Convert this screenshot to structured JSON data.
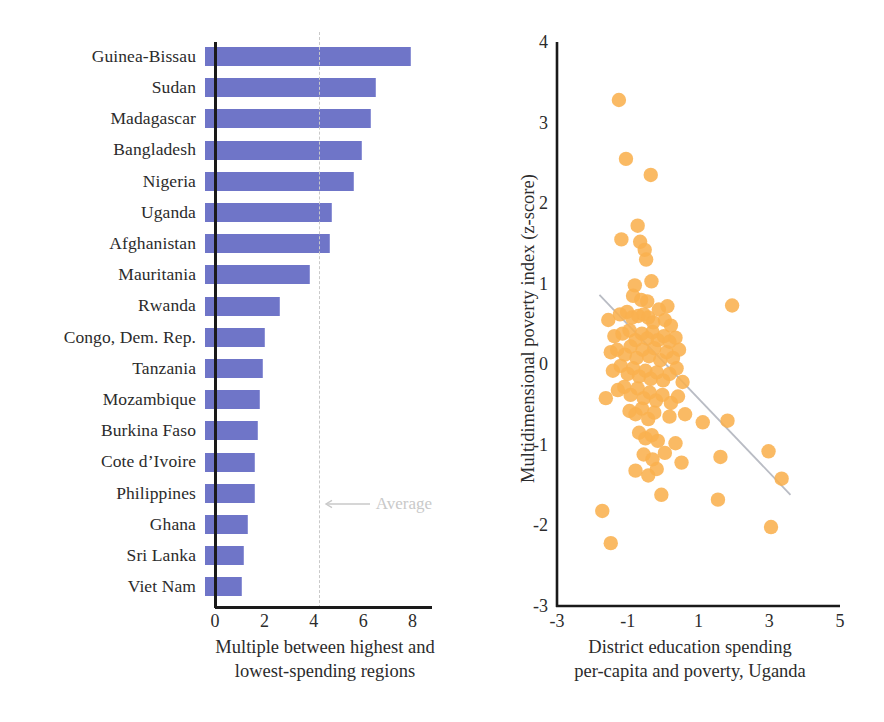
{
  "chart_data": [
    {
      "type": "bar",
      "orientation": "horizontal",
      "title": "",
      "xlabel": "Multiple between highest and lowest-spending regions",
      "ylabel": "",
      "xlim": [
        0,
        9.2
      ],
      "xticks": [
        0,
        2,
        4,
        6,
        8
      ],
      "grid": false,
      "bar_color": "#6f75c8",
      "categories": [
        "Guinea-Bissau",
        "Sudan",
        "Madagascar",
        "Bangladesh",
        "Nigeria",
        "Uganda",
        "Afghanistan",
        "Mauritania",
        "Rwanda",
        "Congo, Dem. Rep.",
        "Tanzania",
        "Mozambique",
        "Burkina Faso",
        "Cote d’Ivoire",
        "Philippines",
        "Ghana",
        "Sri Lanka",
        "Viet Nam"
      ],
      "values": [
        8.3,
        6.9,
        6.7,
        6.3,
        6.0,
        5.1,
        5.0,
        4.2,
        3.0,
        2.4,
        2.3,
        2.2,
        2.1,
        2.0,
        2.0,
        1.7,
        1.55,
        1.45
      ],
      "annotations": [
        {
          "label": "Average",
          "value": 4.2,
          "type": "reference-line",
          "color": "#c9c9c9"
        }
      ]
    },
    {
      "type": "scatter",
      "title": "",
      "xlabel": "District education spending per-capita and poverty, Uganda",
      "xlabel_line1": "District education spending",
      "xlabel_line2": "per-capita and poverty, Uganda",
      "ylabel": "Multidimensional poverty index (z-score)",
      "xlim": [
        -3,
        5
      ],
      "ylim": [
        -3,
        4
      ],
      "xticks": [
        -3,
        -1,
        1,
        3,
        5
      ],
      "yticks": [
        4,
        3,
        2,
        1,
        0,
        -1,
        -2,
        -3
      ],
      "grid": false,
      "point_color": "#f9b04f",
      "trendline": {
        "color": "#b9bcc4",
        "x": [
          -1.8,
          3.6
        ],
        "y": [
          0.86,
          -1.62
        ]
      },
      "points": [
        [
          -1.25,
          3.28
        ],
        [
          -1.05,
          2.55
        ],
        [
          -0.35,
          2.35
        ],
        [
          -0.72,
          1.72
        ],
        [
          -1.18,
          1.55
        ],
        [
          -0.65,
          1.52
        ],
        [
          -0.52,
          1.42
        ],
        [
          -0.48,
          1.3
        ],
        [
          -0.8,
          0.98
        ],
        [
          -0.33,
          1.03
        ],
        [
          -0.85,
          0.85
        ],
        [
          -0.62,
          0.8
        ],
        [
          -0.45,
          0.78
        ],
        [
          0.12,
          0.72
        ],
        [
          1.95,
          0.73
        ],
        [
          -1.55,
          0.55
        ],
        [
          -1.22,
          0.62
        ],
        [
          -1.02,
          0.65
        ],
        [
          -0.88,
          0.58
        ],
        [
          -0.7,
          0.6
        ],
        [
          -0.55,
          0.62
        ],
        [
          -0.42,
          0.58
        ],
        [
          -0.28,
          0.52
        ],
        [
          -0.12,
          0.68
        ],
        [
          0.05,
          0.55
        ],
        [
          0.22,
          0.48
        ],
        [
          -1.38,
          0.35
        ],
        [
          -1.15,
          0.38
        ],
        [
          -0.95,
          0.42
        ],
        [
          -0.78,
          0.3
        ],
        [
          -0.6,
          0.38
        ],
        [
          -0.45,
          0.32
        ],
        [
          -0.3,
          0.4
        ],
        [
          -0.15,
          0.3
        ],
        [
          0.02,
          0.35
        ],
        [
          0.18,
          0.28
        ],
        [
          0.35,
          0.33
        ],
        [
          -1.48,
          0.15
        ],
        [
          -1.3,
          0.18
        ],
        [
          -1.08,
          0.12
        ],
        [
          -0.92,
          0.22
        ],
        [
          -0.75,
          0.08
        ],
        [
          -0.58,
          0.18
        ],
        [
          -0.4,
          0.1
        ],
        [
          -0.25,
          0.2
        ],
        [
          -0.08,
          0.05
        ],
        [
          0.1,
          0.15
        ],
        [
          0.28,
          0.08
        ],
        [
          0.45,
          0.18
        ],
        [
          -1.42,
          -0.08
        ],
        [
          -1.2,
          -0.02
        ],
        [
          -1.0,
          -0.12
        ],
        [
          -0.85,
          -0.05
        ],
        [
          -0.68,
          -0.15
        ],
        [
          -0.5,
          -0.08
        ],
        [
          -0.35,
          -0.18
        ],
        [
          -0.18,
          -0.1
        ],
        [
          0.0,
          -0.2
        ],
        [
          0.18,
          -0.12
        ],
        [
          0.38,
          -0.05
        ],
        [
          0.55,
          -0.22
        ],
        [
          -1.28,
          -0.32
        ],
        [
          -1.1,
          -0.28
        ],
        [
          -0.92,
          -0.38
        ],
        [
          -0.72,
          -0.3
        ],
        [
          -0.55,
          -0.42
        ],
        [
          -0.38,
          -0.35
        ],
        [
          -0.2,
          -0.45
        ],
        [
          -0.02,
          -0.38
        ],
        [
          0.22,
          -0.48
        ],
        [
          0.42,
          -0.4
        ],
        [
          -1.62,
          -0.42
        ],
        [
          -0.95,
          -0.58
        ],
        [
          -0.78,
          -0.62
        ],
        [
          -0.6,
          -0.55
        ],
        [
          -0.42,
          -0.68
        ],
        [
          -0.25,
          -0.6
        ],
        [
          0.18,
          -0.65
        ],
        [
          0.62,
          -0.62
        ],
        [
          1.12,
          -0.72
        ],
        [
          1.82,
          -0.7
        ],
        [
          -0.68,
          -0.85
        ],
        [
          -0.5,
          -0.92
        ],
        [
          -0.32,
          -0.88
        ],
        [
          -0.15,
          -0.95
        ],
        [
          0.35,
          -0.98
        ],
        [
          -0.55,
          -1.12
        ],
        [
          -0.3,
          -1.18
        ],
        [
          0.05,
          -1.1
        ],
        [
          0.52,
          -1.22
        ],
        [
          1.62,
          -1.15
        ],
        [
          -0.78,
          -1.32
        ],
        [
          -0.42,
          -1.38
        ],
        [
          -0.18,
          -1.3
        ],
        [
          2.98,
          -1.08
        ],
        [
          3.35,
          -1.42
        ],
        [
          -0.05,
          -1.62
        ],
        [
          1.55,
          -1.68
        ],
        [
          3.05,
          -2.02
        ],
        [
          -1.72,
          -1.82
        ],
        [
          -1.48,
          -2.22
        ]
      ]
    }
  ],
  "bar_chart": {
    "xticks": [
      "0",
      "2",
      "4",
      "6",
      "8"
    ],
    "xlabel_line1": "Multiple between highest and",
    "xlabel_line2": "lowest-spending regions",
    "average_label": "Average"
  },
  "scatter_chart": {
    "yticks": [
      "4",
      "3",
      "2",
      "1",
      "0",
      "-1",
      "-2",
      "-3"
    ],
    "xticks": [
      "-3",
      "-1",
      "1",
      "3",
      "5"
    ],
    "ylabel": "Multidimensional poverty index (z-score)",
    "xlabel_line1": "District education spending",
    "xlabel_line2": "per-capita and poverty, Uganda"
  },
  "colors": {
    "bar": "#6f75c8",
    "point": "#f9b04f",
    "axis": "#1a1a1a",
    "reference": "#c9c9c9",
    "trend": "#b9bcc4"
  }
}
